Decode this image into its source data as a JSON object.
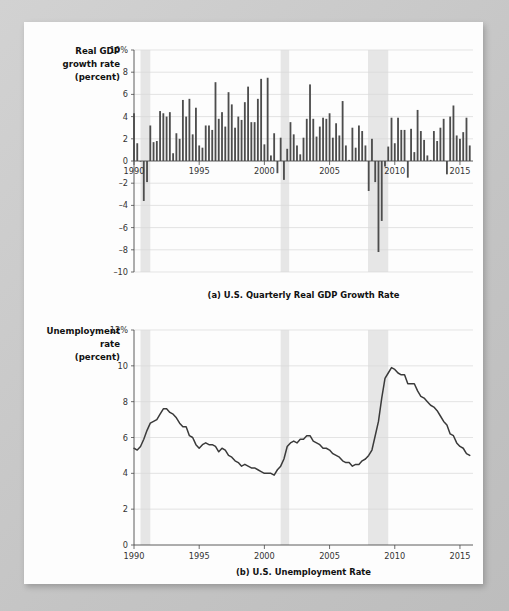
{
  "figure": {
    "background_color": "#fdfdfd",
    "page_color": "#c9c9c9",
    "bar_color": "#4d4d4d",
    "line_color": "#3a3a3a",
    "recession_band_color": "#e6e6e6"
  },
  "panel_a": {
    "axis_label_line1": "Real GDP",
    "axis_label_line2": "growth rate",
    "axis_label_line3": "(percent)",
    "caption": "(a) U.S. Quarterly Real GDP Growth Rate",
    "y_ticks": [
      "10%",
      "8",
      "6",
      "4",
      "2",
      "0",
      "–2",
      "–4",
      "–6",
      "–8",
      "–10"
    ],
    "x_ticks": [
      "1990",
      "1995",
      "2000",
      "2005",
      "2010",
      "2015"
    ]
  },
  "panel_b": {
    "axis_label_line1": "Unemployment",
    "axis_label_line2": "rate",
    "axis_label_line3": "(percent)",
    "caption": "(b) U.S. Unemployment Rate",
    "y_ticks": [
      "12%",
      "10",
      "8",
      "6",
      "4",
      "2",
      "0"
    ],
    "x_ticks": [
      "1990",
      "1995",
      "2000",
      "2005",
      "2010",
      "2015"
    ]
  },
  "chart_data": [
    {
      "type": "bar",
      "title": "(a) U.S. Quarterly Real GDP Growth Rate",
      "xlabel": "",
      "ylabel": "Real GDP growth rate (percent)",
      "ylim": [
        -10,
        10
      ],
      "xlim": [
        1990,
        2016
      ],
      "ytick_step": 2,
      "grid": true,
      "frequency": "quarterly",
      "units": "annualized percent change",
      "recession_bands": [
        [
          1990.5,
          1991.25
        ],
        [
          2001.25,
          2001.9
        ],
        [
          2007.95,
          2009.5
        ]
      ],
      "x": [
        1990.0,
        1990.25,
        1990.5,
        1990.75,
        1991.0,
        1991.25,
        1991.5,
        1991.75,
        1992.0,
        1992.25,
        1992.5,
        1992.75,
        1993.0,
        1993.25,
        1993.5,
        1993.75,
        1994.0,
        1994.25,
        1994.5,
        1994.75,
        1995.0,
        1995.25,
        1995.5,
        1995.75,
        1996.0,
        1996.25,
        1996.5,
        1996.75,
        1997.0,
        1997.25,
        1997.5,
        1997.75,
        1998.0,
        1998.25,
        1998.5,
        1998.75,
        1999.0,
        1999.25,
        1999.5,
        1999.75,
        2000.0,
        2000.25,
        2000.5,
        2000.75,
        2001.0,
        2001.25,
        2001.5,
        2001.75,
        2002.0,
        2002.25,
        2002.5,
        2002.75,
        2003.0,
        2003.25,
        2003.5,
        2003.75,
        2004.0,
        2004.25,
        2004.5,
        2004.75,
        2005.0,
        2005.25,
        2005.5,
        2005.75,
        2006.0,
        2006.25,
        2006.5,
        2006.75,
        2007.0,
        2007.25,
        2007.5,
        2007.75,
        2008.0,
        2008.25,
        2008.5,
        2008.75,
        2009.0,
        2009.25,
        2009.5,
        2009.75,
        2010.0,
        2010.25,
        2010.5,
        2010.75,
        2011.0,
        2011.25,
        2011.5,
        2011.75,
        2012.0,
        2012.25,
        2012.5,
        2012.75,
        2013.0,
        2013.25,
        2013.5,
        2013.75,
        2014.0,
        2014.25,
        2014.5,
        2014.75,
        2015.0,
        2015.25,
        2015.5,
        2015.75
      ],
      "values": [
        4.3,
        1.6,
        0.0,
        -3.6,
        -1.9,
        3.2,
        1.7,
        1.8,
        4.5,
        4.3,
        4.0,
        4.4,
        0.7,
        2.5,
        2.0,
        5.5,
        4.0,
        5.6,
        2.4,
        4.8,
        1.4,
        1.2,
        3.2,
        3.2,
        2.8,
        7.1,
        3.8,
        4.4,
        3.1,
        6.2,
        5.1,
        3.0,
        4.0,
        3.7,
        5.3,
        6.7,
        3.5,
        3.5,
        5.6,
        7.4,
        1.5,
        7.5,
        0.5,
        2.5,
        -1.1,
        2.1,
        -1.7,
        1.1,
        3.5,
        2.4,
        1.4,
        0.6,
        2.1,
        3.8,
        6.9,
        3.8,
        2.2,
        3.1,
        3.9,
        3.8,
        4.3,
        2.1,
        3.4,
        2.3,
        5.4,
        1.4,
        0.1,
        3.0,
        1.2,
        3.2,
        2.7,
        1.4,
        -2.7,
        2.0,
        -1.9,
        -8.2,
        -5.4,
        -0.5,
        1.3,
        3.9,
        1.6,
        3.9,
        2.8,
        2.8,
        -1.5,
        2.9,
        0.8,
        4.6,
        2.7,
        1.9,
        0.5,
        0.1,
        2.7,
        1.8,
        3.0,
        3.8,
        -1.2,
        4.0,
        5.0,
        2.3,
        2.0,
        2.6,
        3.9,
        1.4
      ]
    },
    {
      "type": "line",
      "title": "(b) U.S. Unemployment Rate",
      "xlabel": "",
      "ylabel": "Unemployment rate (percent)",
      "ylim": [
        0,
        12
      ],
      "xlim": [
        1990,
        2016
      ],
      "ytick_step": 2,
      "grid": true,
      "frequency": "monthly",
      "units": "percent of labor force",
      "recession_bands": [
        [
          1990.5,
          1991.25
        ],
        [
          2001.25,
          2001.9
        ],
        [
          2007.95,
          2009.5
        ]
      ],
      "x": [
        1990.0,
        1990.25,
        1990.5,
        1990.75,
        1991.0,
        1991.25,
        1991.5,
        1991.75,
        1992.0,
        1992.25,
        1992.5,
        1992.75,
        1993.0,
        1993.25,
        1993.5,
        1993.75,
        1994.0,
        1994.25,
        1994.5,
        1994.75,
        1995.0,
        1995.25,
        1995.5,
        1995.75,
        1996.0,
        1996.25,
        1996.5,
        1996.75,
        1997.0,
        1997.25,
        1997.5,
        1997.75,
        1998.0,
        1998.25,
        1998.5,
        1998.75,
        1999.0,
        1999.25,
        1999.5,
        1999.75,
        2000.0,
        2000.25,
        2000.5,
        2000.75,
        2001.0,
        2001.25,
        2001.5,
        2001.75,
        2002.0,
        2002.25,
        2002.5,
        2002.75,
        2003.0,
        2003.25,
        2003.5,
        2003.75,
        2004.0,
        2004.25,
        2004.5,
        2004.75,
        2005.0,
        2005.25,
        2005.5,
        2005.75,
        2006.0,
        2006.25,
        2006.5,
        2006.75,
        2007.0,
        2007.25,
        2007.5,
        2007.75,
        2008.0,
        2008.25,
        2008.5,
        2008.75,
        2009.0,
        2009.25,
        2009.5,
        2009.75,
        2010.0,
        2010.25,
        2010.5,
        2010.75,
        2011.0,
        2011.25,
        2011.5,
        2011.75,
        2012.0,
        2012.25,
        2012.5,
        2012.75,
        2013.0,
        2013.25,
        2013.5,
        2013.75,
        2014.0,
        2014.25,
        2014.5,
        2014.75,
        2015.0,
        2015.25,
        2015.5,
        2015.75
      ],
      "values": [
        5.4,
        5.3,
        5.5,
        5.9,
        6.4,
        6.8,
        6.9,
        7.0,
        7.3,
        7.6,
        7.6,
        7.4,
        7.3,
        7.1,
        6.8,
        6.6,
        6.6,
        6.1,
        6.0,
        5.6,
        5.4,
        5.6,
        5.7,
        5.6,
        5.6,
        5.5,
        5.2,
        5.4,
        5.3,
        5.0,
        4.9,
        4.7,
        4.6,
        4.4,
        4.5,
        4.4,
        4.3,
        4.3,
        4.2,
        4.1,
        4.0,
        4.0,
        4.0,
        3.9,
        4.2,
        4.4,
        4.8,
        5.5,
        5.7,
        5.8,
        5.7,
        5.9,
        5.9,
        6.1,
        6.1,
        5.8,
        5.7,
        5.6,
        5.4,
        5.4,
        5.3,
        5.1,
        5.0,
        4.9,
        4.7,
        4.6,
        4.6,
        4.4,
        4.5,
        4.5,
        4.7,
        4.8,
        5.0,
        5.3,
        6.1,
        6.9,
        8.2,
        9.3,
        9.6,
        9.9,
        9.8,
        9.6,
        9.5,
        9.5,
        9.0,
        9.0,
        9.0,
        8.6,
        8.3,
        8.2,
        8.0,
        7.8,
        7.7,
        7.5,
        7.2,
        6.9,
        6.7,
        6.2,
        6.1,
        5.7,
        5.5,
        5.4,
        5.1,
        5.0
      ]
    }
  ]
}
